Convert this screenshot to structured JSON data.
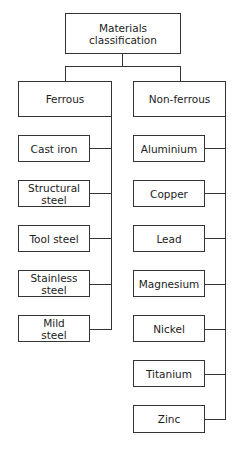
{
  "root": {
    "label": "Materials classification"
  },
  "ferrous": {
    "label": "Ferrous",
    "children": [
      "Cast iron",
      "Structural steel",
      "Tool steel",
      "Stainless steel",
      "Mild steel"
    ]
  },
  "nonferrous": {
    "label": "Non-ferrous",
    "children": [
      "Aluminium",
      "Copper",
      "Lead",
      "Magnesium",
      "Nickel",
      "Titanium",
      "Zinc"
    ]
  }
}
